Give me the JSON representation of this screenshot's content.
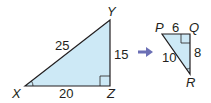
{
  "diagram": {
    "large_triangle": {
      "vertices": {
        "X": "X",
        "Y": "Y",
        "Z": "Z"
      },
      "sides": {
        "XY": "25",
        "YZ": "15",
        "XZ": "20"
      },
      "right_angle_at": "Z",
      "fill": "#cde9f6"
    },
    "small_triangle": {
      "vertices": {
        "P": "P",
        "Q": "Q",
        "R": "R"
      },
      "sides": {
        "PQ": "6",
        "QR": "8",
        "PR": "10"
      },
      "right_angle_at": "Q",
      "fill": "#cde9f6"
    },
    "arrow_color": "#6b6fb5"
  }
}
